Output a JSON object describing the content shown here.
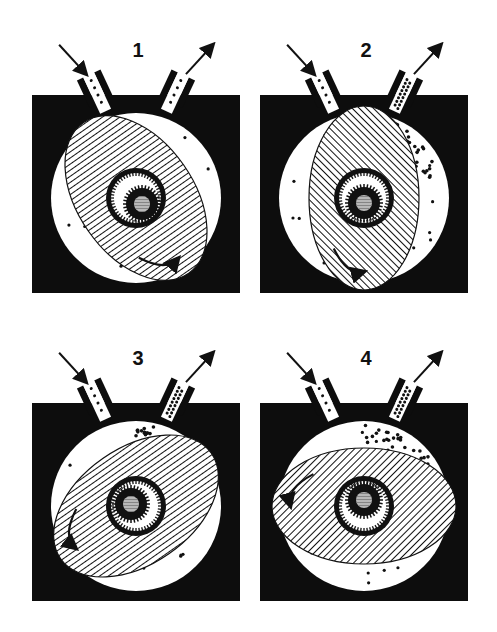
{
  "diagram": {
    "colors": {
      "housing": "#0d0d0d",
      "chamber": "#ffffff",
      "line": "#111111",
      "hub": "#b8b8b8"
    },
    "panels": [
      {
        "label": "1",
        "x": 32,
        "y": 95,
        "rot": -35,
        "rx": 58,
        "ry": 92,
        "hatch": "horizontal",
        "exhaust_dense": false
      },
      {
        "label": "2",
        "x": 260,
        "y": 95,
        "rot": 0,
        "rx": 55,
        "ry": 92,
        "hatch": "diagonal",
        "exhaust_dense": true
      },
      {
        "label": "3",
        "x": 32,
        "y": 403,
        "rot": 55,
        "rx": 58,
        "ry": 92,
        "hatch": "vertical",
        "exhaust_dense": true
      },
      {
        "label": "4",
        "x": 260,
        "y": 403,
        "rot": 90,
        "rx": 58,
        "ry": 92,
        "hatch": "diagonal",
        "exhaust_dense": true
      }
    ]
  }
}
